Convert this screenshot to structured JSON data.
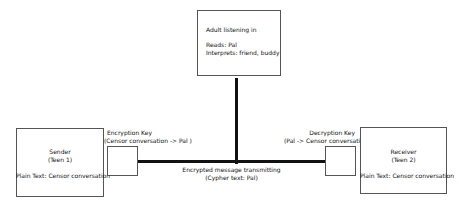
{
  "adult": {
    "title": "Adult listening in",
    "reads": "Reads: Pal",
    "interprets": "Interprets: friend, buddy"
  },
  "sender": {
    "role": "Sender",
    "name": "(Teen 1)",
    "plaintext": "Plain Text: Censor conversation"
  },
  "receiver": {
    "role": "Receiver",
    "name": "(Teen 2)",
    "plaintext": "Plain Text: Censor conversation"
  },
  "encryption_key": {
    "label": "Encryption Key",
    "mapping": "(Censor conversation -> Pal )"
  },
  "decryption_key": {
    "label": "Decryption Key",
    "mapping": "(Pal -> Censor conversation)"
  },
  "channel": {
    "label": "Encrypted message transmitting",
    "ciphertext": "(Cypher text: Pal)"
  }
}
